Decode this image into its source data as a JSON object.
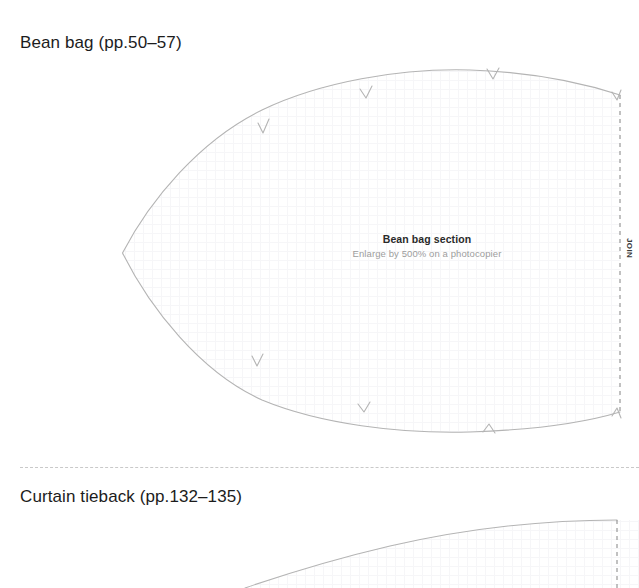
{
  "document": {
    "title": "Sewing pattern sheet",
    "background_color": "#ffffff",
    "outline_color": "#b4b4b4",
    "dash_color": "#9a9a9a",
    "separator_color": "#c9c9c9",
    "grid_color": "#f7f7f9"
  },
  "sections": [
    {
      "id": "bean-bag",
      "title": "Bean bag (pp.50–57)",
      "piece": {
        "name": "Bean bag section",
        "note": "Enlarge by 500% on a photocopier",
        "enlarge_percent": "500%"
      },
      "join_label": "JOIN",
      "edge_type": "dashed-join-edge",
      "notch_count": 6
    },
    {
      "id": "curtain-tieback",
      "title": "Curtain tieback (pp.132–135)",
      "join_label": "",
      "edge_type": "dashed-join-edge",
      "notch_count": 0
    }
  ],
  "separator": {
    "style": "dashed",
    "label": ""
  }
}
